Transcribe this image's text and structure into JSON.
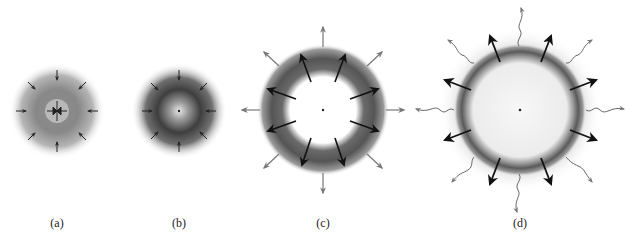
{
  "figure": {
    "panels": [
      {
        "id": "a",
        "label": "(a)",
        "cx": 57,
        "cy": 111,
        "description": "Small cloud with inward arrows, dense light core"
      },
      {
        "id": "b",
        "label": "(b)",
        "cx": 179,
        "cy": 111,
        "description": "Collapsing cloud with inward arrows, dark shell and bright center"
      },
      {
        "id": "c",
        "label": "(c)",
        "cx": 323,
        "cy": 110,
        "description": "Expanding dark ring with outward black and gray arrows, white center"
      },
      {
        "id": "d",
        "label": "(d)",
        "cx": 520,
        "cy": 110,
        "description": "Large expanded shell with outward black arrows and wavy gray radiation arrows"
      }
    ],
    "colors": {
      "background": "#ffffff",
      "shell_dark": "#3a3a3a",
      "arrow_black": "#111111",
      "arrow_gray": "#777777"
    }
  }
}
